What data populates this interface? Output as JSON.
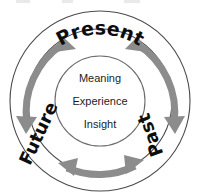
{
  "diagram": {
    "type": "concentric-circle-cycle",
    "colors": {
      "arrow": "#8c8c8c",
      "arrow_dark": "#7f7f7f",
      "ring_stroke": "#4a4a4a",
      "inner_stroke": "#6b6b6b",
      "label_text": "#0d0d0d",
      "core_text": "#1c1c1c",
      "background": "#ffffff"
    },
    "outer_ring": {
      "name": "outer-ring",
      "cx": 100,
      "cy": 101,
      "r": 90
    },
    "mid_ring": {
      "name": "mid-ring",
      "cx": 100,
      "cy": 101,
      "r": 72
    },
    "inner_circle": {
      "name": "inner-circle",
      "cx": 100,
      "cy": 101,
      "r": 45
    },
    "ring_labels": [
      {
        "id": "present",
        "text": "Present",
        "position": "top",
        "font_size": 19,
        "orientation": "curved-along-top-arc"
      },
      {
        "id": "past",
        "text": "Past",
        "position": "right",
        "font_size": 18,
        "orientation": "rotated-reading-downward"
      },
      {
        "id": "future",
        "text": "Future",
        "position": "left",
        "font_size": 18,
        "orientation": "rotated-reading-upward"
      }
    ],
    "core_labels": [
      {
        "id": "meaning",
        "text": "Meaning",
        "y": 82
      },
      {
        "id": "experience",
        "text": "Experience",
        "y": 105
      },
      {
        "id": "insight",
        "text": "Insight",
        "y": 128
      }
    ],
    "arrows": [
      {
        "id": "future-to-present",
        "name": "arrow-future-present",
        "segment": "left-upper",
        "double_headed": true
      },
      {
        "id": "present-to-past",
        "name": "arrow-present-past",
        "segment": "right-upper",
        "double_headed": true
      },
      {
        "id": "past-to-future",
        "name": "arrow-past-future",
        "segment": "bottom",
        "double_headed": true
      }
    ]
  }
}
